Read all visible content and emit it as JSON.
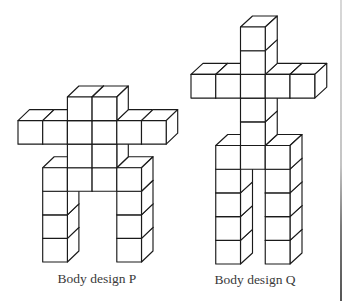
{
  "style": {
    "line_color": "#1a1a1a",
    "face_color": "#ffffff"
  },
  "figures": [
    {
      "name": "body-design-p",
      "label": "Body design P",
      "rows": [
        [
          2,
          3
        ],
        [
          0,
          1,
          2,
          3,
          4,
          5
        ],
        [
          2,
          3
        ],
        [
          1,
          2,
          3,
          4
        ],
        [
          1,
          4
        ],
        [
          1,
          4
        ],
        [
          1,
          4
        ]
      ]
    },
    {
      "name": "body-design-q",
      "label": "Body design Q",
      "rows": [
        [
          2
        ],
        [
          2
        ],
        [
          0,
          1,
          2,
          3,
          4
        ],
        [
          2
        ],
        [
          2
        ],
        [
          1,
          2,
          3
        ],
        [
          1,
          3
        ],
        [
          1,
          3
        ],
        [
          1,
          3
        ],
        [
          1,
          3
        ]
      ]
    }
  ]
}
